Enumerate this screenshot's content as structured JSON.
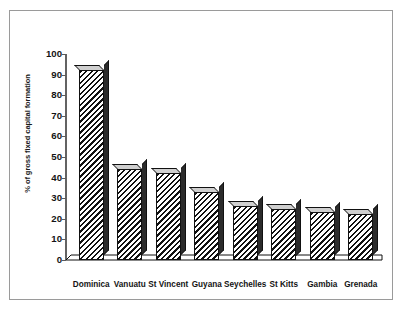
{
  "chart_data": {
    "type": "bar",
    "title": "",
    "subtitle": "",
    "xlabel": "",
    "ylabel": "% of gross fixed capital formation",
    "ylim": [
      0,
      100
    ],
    "ytick_values": [
      100,
      90,
      80,
      70,
      60,
      50,
      40,
      30,
      20,
      10,
      0
    ],
    "ytick_labels": [
      "100",
      "90",
      "80",
      "70",
      "60",
      "50",
      "40",
      "30",
      "20",
      "10",
      "0"
    ],
    "grid": false,
    "legend": "none",
    "orientation": "vertical",
    "style_3d": true,
    "fill_pattern": "diagonal-hatch",
    "categories": [
      "Dominica",
      "Vanuatu",
      "St Vincent",
      "Guyana",
      "Seychelles",
      "St Kitts",
      "Gambia",
      "Grenada"
    ],
    "values": [
      92,
      44,
      42,
      33,
      26,
      25,
      23.5,
      22.5
    ],
    "annotations": []
  },
  "colors": {
    "frame_border": "#9a9a9a",
    "background": "#ffffff",
    "bar_outline": "#111111",
    "bar_hatch": "#111111",
    "bar_side_face": "#2b2b2b",
    "bar_top_face": "#cfcfcf",
    "axis_line": "#3c3c3c",
    "text": "#141414"
  }
}
